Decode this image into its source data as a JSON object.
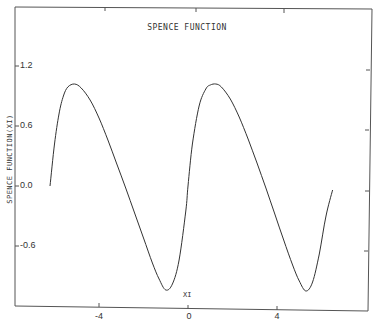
{
  "chart_data": {
    "type": "line",
    "title": "SPENCE FUNCTION",
    "xlabel": "XI",
    "ylabel": "SPENCE FUNCTION(XI)",
    "xlim": [
      -8,
      8
    ],
    "ylim": [
      -1.2,
      1.8
    ],
    "xticks": [
      "-4",
      "0",
      "4"
    ],
    "yticks": [
      "1.2",
      "0.6",
      "0.0",
      "-0.6"
    ],
    "grid": false,
    "legend": null,
    "series": [
      {
        "name": "SPENCE FUNCTION",
        "x": [
          -6.2,
          -6.0,
          -5.8,
          -5.6,
          -5.4,
          -5.1,
          -4.8,
          -4.4,
          -4.0,
          -3.6,
          -3.2,
          -2.8,
          -2.4,
          -2.0,
          -1.6,
          -1.3,
          -1.0,
          -0.7,
          -0.4,
          -0.1,
          0.0,
          0.2,
          0.5,
          0.8,
          1.0,
          1.25,
          1.5,
          1.9,
          2.3,
          2.7,
          3.1,
          3.5,
          3.9,
          4.3,
          4.7,
          5.0,
          5.3,
          5.6,
          5.9,
          6.2,
          6.5
        ],
        "y": [
          0.0,
          0.42,
          0.72,
          0.9,
          0.99,
          1.02,
          0.98,
          0.86,
          0.68,
          0.46,
          0.22,
          -0.02,
          -0.27,
          -0.52,
          -0.77,
          -0.93,
          -1.04,
          -0.98,
          -0.74,
          -0.25,
          0.0,
          0.42,
          0.8,
          0.97,
          1.01,
          1.02,
          0.99,
          0.87,
          0.69,
          0.47,
          0.23,
          -0.02,
          -0.28,
          -0.54,
          -0.79,
          -0.95,
          -1.05,
          -0.96,
          -0.68,
          -0.3,
          -0.04
        ]
      }
    ]
  }
}
